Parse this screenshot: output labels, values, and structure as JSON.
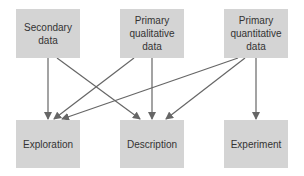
{
  "diagram": {
    "sources": [
      {
        "id": "secondary",
        "label": "Secondary data",
        "lines": [
          "Secondary",
          "data"
        ]
      },
      {
        "id": "qualitative",
        "label": "Primary qualitative data",
        "lines": [
          "Primary",
          "qualitative",
          "data"
        ]
      },
      {
        "id": "quantitative",
        "label": "Primary quantitative data",
        "lines": [
          "Primary",
          "quantitative",
          "data"
        ]
      }
    ],
    "targets": [
      {
        "id": "exploration",
        "label": "Exploration"
      },
      {
        "id": "description",
        "label": "Description"
      },
      {
        "id": "experiment",
        "label": "Experiment"
      }
    ],
    "edges": [
      {
        "from": "secondary",
        "to": "exploration"
      },
      {
        "from": "secondary",
        "to": "description"
      },
      {
        "from": "qualitative",
        "to": "exploration"
      },
      {
        "from": "qualitative",
        "to": "description"
      },
      {
        "from": "quantitative",
        "to": "exploration"
      },
      {
        "from": "quantitative",
        "to": "description"
      },
      {
        "from": "quantitative",
        "to": "experiment"
      }
    ],
    "colors": {
      "box": "#d4d4d4",
      "text": "#333333",
      "arrow": "#666666",
      "background": "#ffffff"
    }
  }
}
